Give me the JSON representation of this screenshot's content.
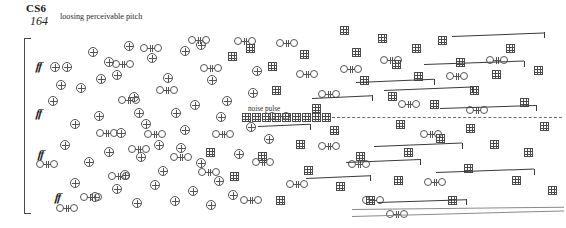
{
  "page": {
    "width": 566,
    "height": 228,
    "background": "#ffffff"
  },
  "header": {
    "title": "CS6",
    "measure_number": "164",
    "performance_note": "loosing perceivable pitch"
  },
  "annotations": {
    "noise_pulse_label": "noise pulse"
  },
  "colors": {
    "ink": "#1b1b1b",
    "glyph_stroke": "#555555",
    "grid_stroke": "#4a4a4a",
    "beam": "#3a3a3a",
    "dashed_line": "#6d6d6d",
    "hairpin": "#8a8a8a"
  },
  "dynamics": [
    {
      "label": "ff",
      "x": 36,
      "y": 60
    },
    {
      "label": "ff",
      "x": 36,
      "y": 107
    },
    {
      "label": "ff",
      "x": 38,
      "y": 148
    },
    {
      "label": "ff",
      "x": 55,
      "y": 191
    }
  ],
  "system_bracket": {
    "x": 24,
    "y": 38,
    "height": 176
  },
  "noise_pulse": {
    "label_x": 248,
    "label_y": 105,
    "row_y": 113,
    "squares_x": [
      242,
      252,
      262,
      272,
      282,
      292,
      302,
      312,
      322
    ],
    "dash_x": 332,
    "dash_y": 117,
    "dash_width": 230
  },
  "hairpins": [
    {
      "x": 352,
      "y": 209,
      "width": 212,
      "angle": -0.6
    },
    {
      "x": 352,
      "y": 216,
      "width": 212,
      "angle": -1.5
    }
  ],
  "glyphs": {
    "plus": [
      {
        "x": 62,
        "y": 62
      },
      {
        "x": 88,
        "y": 47
      },
      {
        "x": 56,
        "y": 80
      },
      {
        "x": 76,
        "y": 83
      },
      {
        "x": 112,
        "y": 70
      },
      {
        "x": 129,
        "y": 92
      },
      {
        "x": 104,
        "y": 57
      },
      {
        "x": 147,
        "y": 53
      },
      {
        "x": 163,
        "y": 73
      },
      {
        "x": 180,
        "y": 46
      },
      {
        "x": 196,
        "y": 40
      },
      {
        "x": 207,
        "y": 75
      },
      {
        "x": 190,
        "y": 100
      },
      {
        "x": 70,
        "y": 119
      },
      {
        "x": 94,
        "y": 111
      },
      {
        "x": 116,
        "y": 128
      },
      {
        "x": 141,
        "y": 119
      },
      {
        "x": 154,
        "y": 140
      },
      {
        "x": 171,
        "y": 108
      },
      {
        "x": 222,
        "y": 96
      },
      {
        "x": 246,
        "y": 122
      },
      {
        "x": 60,
        "y": 140
      },
      {
        "x": 84,
        "y": 157
      },
      {
        "x": 104,
        "y": 147
      },
      {
        "x": 120,
        "y": 170
      },
      {
        "x": 136,
        "y": 152
      },
      {
        "x": 158,
        "y": 166
      },
      {
        "x": 176,
        "y": 143
      },
      {
        "x": 196,
        "y": 158
      },
      {
        "x": 214,
        "y": 176
      },
      {
        "x": 234,
        "y": 149
      },
      {
        "x": 70,
        "y": 178
      },
      {
        "x": 90,
        "y": 192
      },
      {
        "x": 112,
        "y": 184
      },
      {
        "x": 132,
        "y": 198
      },
      {
        "x": 150,
        "y": 180
      },
      {
        "x": 170,
        "y": 196
      },
      {
        "x": 188,
        "y": 186
      },
      {
        "x": 206,
        "y": 200
      },
      {
        "x": 228,
        "y": 190
      },
      {
        "x": 48,
        "y": 96
      },
      {
        "x": 50,
        "y": 62
      },
      {
        "x": 124,
        "y": 41
      },
      {
        "x": 252,
        "y": 66
      },
      {
        "x": 248,
        "y": 88
      },
      {
        "x": 264,
        "y": 134
      },
      {
        "x": 180,
        "y": 125
      },
      {
        "x": 96,
        "y": 74
      },
      {
        "x": 134,
        "y": 108
      },
      {
        "x": 216,
        "y": 112
      }
    ],
    "double": [
      {
        "x": 112,
        "y": 60
      },
      {
        "x": 140,
        "y": 44
      },
      {
        "x": 188,
        "y": 36
      },
      {
        "x": 156,
        "y": 86
      },
      {
        "x": 118,
        "y": 96
      },
      {
        "x": 96,
        "y": 129
      },
      {
        "x": 144,
        "y": 130
      },
      {
        "x": 200,
        "y": 64
      },
      {
        "x": 234,
        "y": 37
      },
      {
        "x": 276,
        "y": 39
      },
      {
        "x": 296,
        "y": 70
      },
      {
        "x": 340,
        "y": 65
      },
      {
        "x": 380,
        "y": 56
      },
      {
        "x": 318,
        "y": 90
      },
      {
        "x": 36,
        "y": 160
      },
      {
        "x": 56,
        "y": 204
      },
      {
        "x": 128,
        "y": 145
      },
      {
        "x": 170,
        "y": 153
      },
      {
        "x": 198,
        "y": 168
      },
      {
        "x": 252,
        "y": 158
      },
      {
        "x": 240,
        "y": 196
      },
      {
        "x": 286,
        "y": 180
      },
      {
        "x": 318,
        "y": 142
      },
      {
        "x": 348,
        "y": 160
      },
      {
        "x": 362,
        "y": 196
      },
      {
        "x": 398,
        "y": 100
      },
      {
        "x": 420,
        "y": 130
      },
      {
        "x": 446,
        "y": 72
      },
      {
        "x": 466,
        "y": 106
      },
      {
        "x": 486,
        "y": 56
      },
      {
        "x": 424,
        "y": 178
      },
      {
        "x": 386,
        "y": 210
      },
      {
        "x": 108,
        "y": 172
      },
      {
        "x": 212,
        "y": 130
      },
      {
        "x": 268,
        "y": 112
      },
      {
        "x": 80,
        "y": 193
      }
    ],
    "grid": [
      {
        "x": 228,
        "y": 52
      },
      {
        "x": 246,
        "y": 44
      },
      {
        "x": 268,
        "y": 62
      },
      {
        "x": 272,
        "y": 86
      },
      {
        "x": 300,
        "y": 50
      },
      {
        "x": 312,
        "y": 104
      },
      {
        "x": 352,
        "y": 48
      },
      {
        "x": 340,
        "y": 26
      },
      {
        "x": 378,
        "y": 34
      },
      {
        "x": 392,
        "y": 60
      },
      {
        "x": 412,
        "y": 44
      },
      {
        "x": 414,
        "y": 72
      },
      {
        "x": 438,
        "y": 36
      },
      {
        "x": 456,
        "y": 58
      },
      {
        "x": 470,
        "y": 86
      },
      {
        "x": 492,
        "y": 70
      },
      {
        "x": 506,
        "y": 44
      },
      {
        "x": 520,
        "y": 98
      },
      {
        "x": 534,
        "y": 66
      },
      {
        "x": 430,
        "y": 100
      },
      {
        "x": 388,
        "y": 92
      },
      {
        "x": 360,
        "y": 76
      },
      {
        "x": 296,
        "y": 140
      },
      {
        "x": 330,
        "y": 126
      },
      {
        "x": 356,
        "y": 152
      },
      {
        "x": 304,
        "y": 166
      },
      {
        "x": 336,
        "y": 182
      },
      {
        "x": 366,
        "y": 196
      },
      {
        "x": 404,
        "y": 148
      },
      {
        "x": 436,
        "y": 134
      },
      {
        "x": 464,
        "y": 164
      },
      {
        "x": 490,
        "y": 140
      },
      {
        "x": 512,
        "y": 176
      },
      {
        "x": 524,
        "y": 148
      },
      {
        "x": 540,
        "y": 122
      },
      {
        "x": 548,
        "y": 186
      },
      {
        "x": 394,
        "y": 176
      },
      {
        "x": 448,
        "y": 196
      },
      {
        "x": 258,
        "y": 152
      },
      {
        "x": 276,
        "y": 196
      },
      {
        "x": 230,
        "y": 172
      },
      {
        "x": 206,
        "y": 148
      },
      {
        "x": 396,
        "y": 120
      },
      {
        "x": 466,
        "y": 124
      }
    ],
    "beams": [
      {
        "x": 452,
        "y": 36,
        "w": 92,
        "angle": -2.2
      },
      {
        "x": 356,
        "y": 82,
        "w": 78,
        "angle": -2.4
      },
      {
        "x": 424,
        "y": 64,
        "w": 100,
        "angle": -2.0
      },
      {
        "x": 312,
        "y": 98,
        "w": 60,
        "angle": -2.6
      },
      {
        "x": 384,
        "y": 90,
        "w": 88,
        "angle": -2.2
      },
      {
        "x": 440,
        "y": 108,
        "w": 96,
        "angle": -1.8
      },
      {
        "x": 346,
        "y": 162,
        "w": 74,
        "angle": -2.4
      },
      {
        "x": 374,
        "y": 146,
        "w": 88,
        "angle": -2.2
      },
      {
        "x": 436,
        "y": 172,
        "w": 98,
        "angle": -2.0
      },
      {
        "x": 306,
        "y": 178,
        "w": 64,
        "angle": -2.4
      },
      {
        "x": 378,
        "y": 202,
        "w": 88,
        "angle": -1.8
      },
      {
        "x": 258,
        "y": 126,
        "w": 52,
        "angle": -2.6
      }
    ]
  }
}
